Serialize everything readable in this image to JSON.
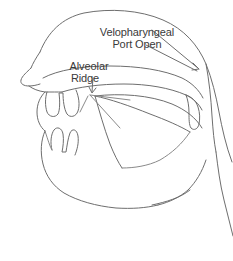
{
  "figure": {
    "width": 233,
    "height": 261,
    "background_color": "#ffffff",
    "line_color": "#6e6e6e",
    "text_color": "#3a3a3a"
  },
  "labels": {
    "velopharyngeal": {
      "line1": "Velopharyngeal",
      "line2": "Port Open"
    },
    "alveolar": {
      "line1": "Alveolar",
      "line2": "Ridge"
    }
  },
  "annotations": [
    {
      "name": "velopharyngeal-port-open",
      "text": "Velopharyngeal Port Open",
      "pointer": "long diagonal arrow to the velopharyngeal port at the back of the soft palate"
    },
    {
      "name": "alveolar-ridge",
      "text": "Alveolar Ridge",
      "pointer": "short downward arrow to the alveolar ridge behind the upper teeth"
    }
  ],
  "anatomy_parts": [
    "head-outline",
    "nasal-cavity",
    "nose",
    "hard-palate",
    "soft-palate-velum",
    "uvula",
    "upper-teeth",
    "lower-teeth",
    "tongue",
    "lips",
    "jaw",
    "chin",
    "pharynx",
    "neck"
  ]
}
